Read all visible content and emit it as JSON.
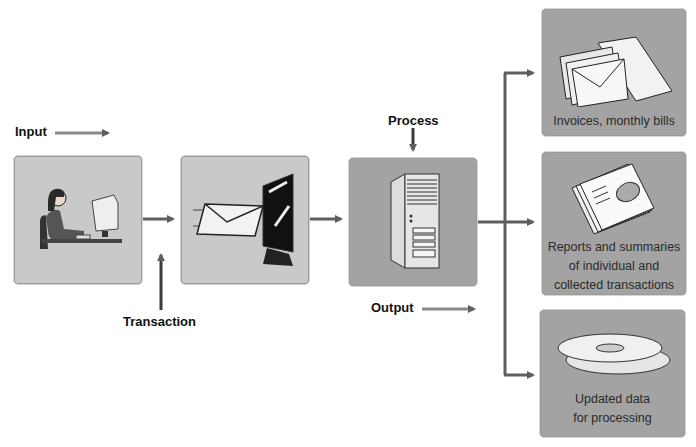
{
  "labels": {
    "input": "Input",
    "transaction": "Transaction",
    "process": "Process",
    "output": "Output"
  },
  "stages": [
    {
      "id": "input",
      "icon": "person-at-computer-icon"
    },
    {
      "id": "transaction",
      "icon": "envelope-entering-monitor-icon"
    },
    {
      "id": "process",
      "icon": "server-tower-icon"
    }
  ],
  "outputs": [
    {
      "icon": "envelopes-icon",
      "caption": "Invoices, monthly bills"
    },
    {
      "icon": "report-documents-icon",
      "caption_lines": [
        "Reports and summaries",
        "of individual and",
        "collected transactions"
      ]
    },
    {
      "icon": "optical-discs-icon",
      "caption_lines": [
        "Updated data",
        "for processing"
      ]
    }
  ],
  "colors": {
    "arrow": "#6a6a6a",
    "box_light": "#c9c9c9",
    "box_dark": "#a3a3a3"
  }
}
